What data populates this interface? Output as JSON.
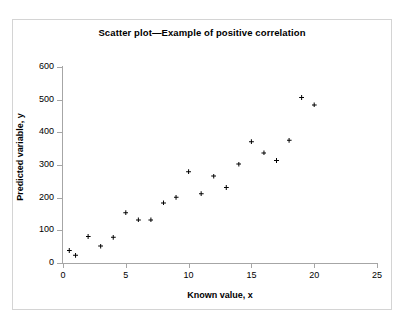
{
  "chart_data": {
    "type": "scatter",
    "title": "Scatter plot—Example of positive correlation",
    "xlabel": "Known value, x",
    "ylabel": "Predicted variable, y",
    "xlim": [
      0,
      25
    ],
    "ylim": [
      0,
      600
    ],
    "xticks": [
      0,
      5,
      10,
      15,
      20,
      25
    ],
    "yticks": [
      0,
      100,
      200,
      300,
      400,
      500,
      600
    ],
    "xtick_labels": [
      "0",
      "5",
      "10",
      "15",
      "20",
      "25"
    ],
    "ytick_labels": [
      "0",
      "100",
      "200",
      "300",
      "400",
      "500",
      "600"
    ],
    "grid": false,
    "legend": null,
    "marker": "plus-filled",
    "marker_color": "#000000",
    "points": [
      {
        "x": 0.5,
        "y": 38
      },
      {
        "x": 1.0,
        "y": 24
      },
      {
        "x": 2.0,
        "y": 81
      },
      {
        "x": 3.0,
        "y": 52
      },
      {
        "x": 4.0,
        "y": 79
      },
      {
        "x": 5.0,
        "y": 154
      },
      {
        "x": 6.0,
        "y": 132
      },
      {
        "x": 7.0,
        "y": 132
      },
      {
        "x": 8.0,
        "y": 184
      },
      {
        "x": 9.0,
        "y": 201
      },
      {
        "x": 10.0,
        "y": 279
      },
      {
        "x": 11.0,
        "y": 212
      },
      {
        "x": 12.0,
        "y": 266
      },
      {
        "x": 13.0,
        "y": 231
      },
      {
        "x": 14.0,
        "y": 303
      },
      {
        "x": 15.0,
        "y": 371
      },
      {
        "x": 16.0,
        "y": 337
      },
      {
        "x": 17.0,
        "y": 314
      },
      {
        "x": 18.0,
        "y": 376
      },
      {
        "x": 19.0,
        "y": 507
      },
      {
        "x": 20.0,
        "y": 484
      }
    ]
  }
}
